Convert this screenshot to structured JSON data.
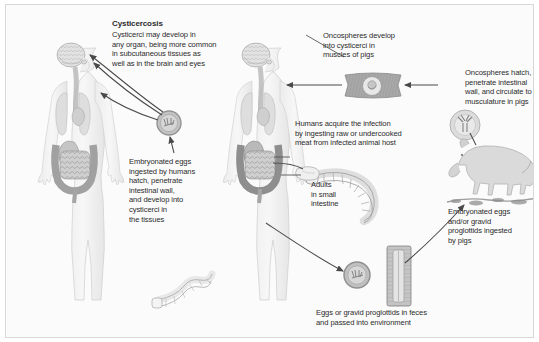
{
  "figure": {
    "kind": "life-cycle-diagram",
    "background_color": "#fbfbfb",
    "border_color": "#d8d8d8",
    "text_color": "#2b2b2b"
  },
  "labels": {
    "title": "Cysticercosis",
    "title_body": "Cysticerci may develop in\nany organ, being more common\nin subcutaneous tissues as\nwell as in the brain and eyes",
    "embryonated_eggs_humans": "Embryonated eggs\ningested by humans\nhatch, penetrate\nintestinal wall,\nand develop into\ncysticerci in\nthe tissues",
    "oncospheres_develop": "Oncospheres develop\ninto cysticerci in\nmuscles of pigs",
    "oncospheres_hatch": "Oncospheres hatch,\npenetrate intestinal\nwall, and circulate to\nmusculature in pigs",
    "humans_acquire": "Humans acquire the infection\nby ingesting raw or undercooked\nmeat from infected animal host",
    "adults_small_intestine": "Adults\nin small\nintestine",
    "embryonated_eggs_pigs": "Embryonated eggs\nand/or gravid\nproglottids ingested\nby pigs",
    "eggs_in_feces": "Eggs or gravid proglottids in feces\nand passed into environment"
  },
  "art": {
    "human_left": {
      "name": "human-figure-with-organs-left",
      "cysticerci_sites": [
        "brain",
        "eye",
        "subcutaneous tissue"
      ]
    },
    "human_right": {
      "name": "human-figure-with-organs-right"
    },
    "egg_left": {
      "name": "embryonated-egg",
      "color": "#b9b9b9"
    },
    "egg_feces": {
      "name": "embryonated-egg-in-feces",
      "color": "#b9b9b9"
    },
    "muscle_block": {
      "name": "pig-muscle-with-cysticercus",
      "color": "#a9a9a9"
    },
    "oncosphere": {
      "name": "oncosphere-with-hooklets",
      "color": "#cfcfcf"
    },
    "pig_standing": {
      "name": "pig-illustration",
      "color": "#d9d9d9"
    },
    "pig_rooting": {
      "name": "pig-rooting-in-ground",
      "color": "#cdcdcd"
    },
    "tapeworm_adult": {
      "name": "adult-tapeworm",
      "color": "#f4f4f4"
    },
    "tapeworm_left": {
      "name": "adult-tapeworm-secondary",
      "color": "#f6f6f6"
    },
    "proglottid_strip": {
      "name": "gravid-proglottid-strip",
      "color": "#bfbfbf"
    },
    "meat_piece": {
      "name": "raw-meat-piece",
      "color": "#efefef"
    }
  },
  "arrows": {
    "count": 11,
    "color": "#4a4a4a",
    "notes": "directional life-cycle arrows connecting hosts, eggs, cysticerci and labels"
  }
}
